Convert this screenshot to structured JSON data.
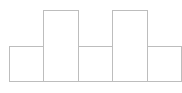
{
  "chart_data": {
    "type": "bar",
    "title": "",
    "xlabel": "",
    "ylabel": "",
    "categories": [
      "1",
      "2",
      "3",
      "4",
      "5"
    ],
    "values": [
      1,
      2,
      1,
      2,
      1
    ],
    "ylim": [
      0,
      2
    ],
    "grid": false,
    "legend": null,
    "style": {
      "fill": "#ffffff",
      "stroke": "#bdbdbd"
    }
  }
}
